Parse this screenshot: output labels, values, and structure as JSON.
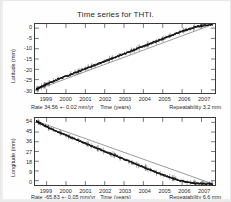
{
  "figure": {
    "title": "Time series for THTI.",
    "station": "THTI"
  },
  "chart_data": [
    {
      "type": "scatter",
      "panel": "latitude",
      "title": "Time series for THTI.",
      "xlabel": "Time (years)",
      "ylabel": "Latitude (mm)",
      "xlim": [
        1998.4,
        2007.7
      ],
      "ylim": [
        -31.5,
        2.0
      ],
      "yticks": [
        0,
        -5,
        -10,
        -15,
        -20,
        -25,
        -30
      ],
      "ytick_labels": [
        "0",
        "-5",
        "-10",
        "-15",
        "-20",
        "-25",
        "-30"
      ],
      "xticks": [
        1999,
        2000,
        2001,
        2002,
        2003,
        2004,
        2005,
        2006,
        2007
      ],
      "xtick_labels": [
        "1999",
        "2000",
        "2001",
        "2002",
        "2003",
        "2004",
        "2005",
        "2006",
        "2007"
      ],
      "grid": false,
      "rate_text": "Rate 34.56 +- 0.02 mm/yr",
      "rate_value": 34.56,
      "rate_sigma": 0.02,
      "rate_units": "mm/yr",
      "repeatability_text": "Repeatability 3.2 mm",
      "repeatability_value": 3.2,
      "series": [
        {
          "name": "Latitude residual",
          "marker": "point-with-errorbar",
          "color": "#111111",
          "x": [
            1998.48,
            1998.52,
            1998.57,
            1998.62,
            1998.7,
            1998.78,
            1998.86,
            1998.94,
            1999.02,
            1999.12,
            1999.22,
            1999.33,
            1999.44,
            1999.55,
            1999.66,
            1999.77,
            1999.88,
            1999.99,
            2000.1,
            2000.21,
            2000.32,
            2000.43,
            2000.54,
            2000.65,
            2000.76,
            2000.87,
            2000.98,
            2001.09,
            2001.2,
            2001.31,
            2001.42,
            2001.53,
            2001.64,
            2001.75,
            2001.86,
            2001.97,
            2002.08,
            2002.19,
            2002.3,
            2002.41,
            2002.52,
            2002.63,
            2002.74,
            2002.85,
            2002.96,
            2003.07,
            2003.18,
            2003.29,
            2003.4,
            2003.51,
            2003.62,
            2003.73,
            2003.84,
            2003.95,
            2004.06,
            2004.17,
            2004.28,
            2004.39,
            2004.5,
            2004.61,
            2004.72,
            2004.83,
            2004.94,
            2005.05,
            2005.16,
            2005.27,
            2005.38,
            2005.49,
            2005.6,
            2005.71,
            2005.82,
            2005.93,
            2006.04,
            2006.15,
            2006.26,
            2006.37,
            2006.48,
            2006.59,
            2006.7,
            2006.81,
            2006.92,
            2007.03,
            2007.14,
            2007.25,
            2007.36,
            2007.47,
            2007.58
          ],
          "y": [
            -29.6,
            -29.4,
            -29.3,
            -29.0,
            -28.6,
            -28.2,
            -27.9,
            -27.5,
            -27.1,
            -26.7,
            -26.3,
            -25.9,
            -25.5,
            -25.0,
            -24.6,
            -24.2,
            -23.8,
            -23.4,
            -23.0,
            -22.6,
            -22.2,
            -21.8,
            -21.4,
            -21.0,
            -20.6,
            -20.2,
            -19.8,
            -19.4,
            -19.0,
            -18.6,
            -18.2,
            -17.8,
            -17.4,
            -17.0,
            -16.6,
            -16.2,
            -15.8,
            -15.4,
            -15.0,
            -14.6,
            -14.2,
            -13.8,
            -13.4,
            -13.0,
            -12.6,
            -12.2,
            -11.8,
            -11.4,
            -11.0,
            -10.6,
            -10.2,
            -9.8,
            -9.4,
            -9.0,
            -8.6,
            -8.2,
            -7.8,
            -7.4,
            -7.0,
            -6.6,
            -6.2,
            -5.8,
            -5.4,
            -5.0,
            -4.6,
            -4.2,
            -3.8,
            -3.4,
            -3.0,
            -2.6,
            -2.2,
            -1.8,
            -1.4,
            -1.0,
            -0.7,
            -0.4,
            0.0,
            0.3,
            0.6,
            0.8,
            1.0,
            1.2,
            1.3,
            1.5,
            1.6,
            1.7,
            1.8
          ]
        },
        {
          "name": "Linear fit",
          "marker": "line",
          "color": "#555555",
          "x": [
            1998.45,
            2007.62
          ],
          "y": [
            -30.0,
            1.9
          ]
        }
      ]
    },
    {
      "type": "scatter",
      "panel": "longitude",
      "xlabel": "Time (years)",
      "ylabel": "Longitude (mm)",
      "xlim": [
        1998.4,
        2007.7
      ],
      "ylim": [
        -4.0,
        58.0
      ],
      "yticks": [
        54,
        45,
        36,
        27,
        18,
        9,
        0
      ],
      "ytick_labels": [
        "54",
        "45",
        "36",
        "27",
        "18",
        "9",
        "0"
      ],
      "xticks": [
        1999,
        2000,
        2001,
        2002,
        2003,
        2004,
        2005,
        2006,
        2007
      ],
      "xtick_labels": [
        "1999",
        "2000",
        "2001",
        "2002",
        "2003",
        "2004",
        "2005",
        "2006",
        "2007"
      ],
      "grid": false,
      "rate_text": "Rate -65.83 +- 0.05 mm/yr",
      "rate_value": -65.83,
      "rate_sigma": 0.05,
      "rate_units": "mm/yr",
      "repeatability_text": "Repeatability 6.6 mm",
      "repeatability_value": 6.6,
      "series": [
        {
          "name": "Longitude residual",
          "marker": "point-with-errorbar",
          "color": "#111111",
          "x": [
            1998.48,
            1998.52,
            1998.57,
            1998.62,
            1998.7,
            1998.78,
            1998.86,
            1998.94,
            1999.02,
            1999.12,
            1999.22,
            1999.33,
            1999.44,
            1999.55,
            1999.66,
            1999.77,
            1999.88,
            1999.99,
            2000.1,
            2000.21,
            2000.32,
            2000.43,
            2000.54,
            2000.65,
            2000.76,
            2000.87,
            2000.98,
            2001.09,
            2001.2,
            2001.31,
            2001.42,
            2001.53,
            2001.64,
            2001.75,
            2001.86,
            2001.97,
            2002.08,
            2002.19,
            2002.3,
            2002.41,
            2002.52,
            2002.63,
            2002.74,
            2002.85,
            2002.96,
            2003.07,
            2003.18,
            2003.29,
            2003.4,
            2003.51,
            2003.62,
            2003.73,
            2003.84,
            2003.95,
            2004.06,
            2004.17,
            2004.28,
            2004.39,
            2004.5,
            2004.61,
            2004.72,
            2004.83,
            2004.94,
            2005.05,
            2005.16,
            2005.27,
            2005.38,
            2005.49,
            2005.6,
            2005.71,
            2005.82,
            2005.93,
            2006.04,
            2006.15,
            2006.26,
            2006.37,
            2006.48,
            2006.59,
            2006.7,
            2006.81,
            2006.92,
            2007.03,
            2007.14,
            2007.25,
            2007.36,
            2007.47,
            2007.58
          ],
          "y": [
            55.0,
            54.6,
            54.2,
            53.6,
            52.8,
            52.0,
            51.3,
            50.5,
            49.7,
            48.9,
            48.1,
            47.2,
            46.3,
            45.5,
            44.6,
            43.8,
            43.0,
            42.1,
            41.3,
            40.4,
            39.6,
            38.8,
            37.9,
            37.1,
            36.3,
            35.5,
            34.6,
            33.8,
            33.0,
            32.2,
            31.4,
            30.6,
            29.8,
            29.0,
            28.2,
            27.4,
            26.6,
            25.8,
            25.0,
            24.2,
            23.4,
            22.6,
            21.8,
            21.0,
            20.2,
            19.4,
            18.6,
            17.8,
            17.0,
            16.2,
            15.4,
            14.6,
            13.8,
            13.0,
            12.2,
            11.4,
            10.6,
            9.8,
            9.0,
            8.2,
            7.4,
            6.6,
            5.8,
            5.1,
            4.4,
            3.7,
            3.0,
            2.4,
            1.8,
            1.2,
            0.6,
            0.0,
            -0.5,
            -1.0,
            -1.4,
            -1.7,
            -2.0,
            -2.2,
            -2.4,
            -2.5,
            -2.6,
            -2.7,
            -2.8,
            -2.9,
            -3.0,
            -3.1,
            -3.2
          ]
        },
        {
          "name": "Linear fit",
          "marker": "line",
          "color": "#555555",
          "x": [
            1998.45,
            2007.62
          ],
          "y": [
            55.2,
            -3.2
          ]
        }
      ]
    }
  ],
  "panels": {
    "latitude": {
      "ylabel": "Latitude (mm)",
      "ytick_labels": [
        "0",
        "-5",
        "-10",
        "-15",
        "-20",
        "-25",
        "-30"
      ],
      "xtick_labels": [
        "1999",
        "2000",
        "2001",
        "2002",
        "2003",
        "2004",
        "2005",
        "2006",
        "2007"
      ],
      "rate_text": "Rate 34.56 +- 0.02 mm/yr",
      "xlabel": "Time (years)",
      "repeatability_text": "Repeatability 3.2 mm"
    },
    "longitude": {
      "ylabel": "Longitude (mm)",
      "ytick_labels": [
        "54",
        "45",
        "36",
        "27",
        "18",
        "9",
        "0"
      ],
      "xtick_labels": [
        "1999",
        "2000",
        "2001",
        "2002",
        "2003",
        "2004",
        "2005",
        "2006",
        "2007"
      ],
      "rate_text": "Rate -65.83 +- 0.05 mm/yr",
      "xlabel": "Time (years)",
      "repeatability_text": "Repeatability 6.6 mm"
    }
  },
  "colors": {
    "data": "#111111",
    "fit": "#555555",
    "axis": "#3a3a3a",
    "text": "#2b2b2b",
    "background": "#ffffff"
  }
}
